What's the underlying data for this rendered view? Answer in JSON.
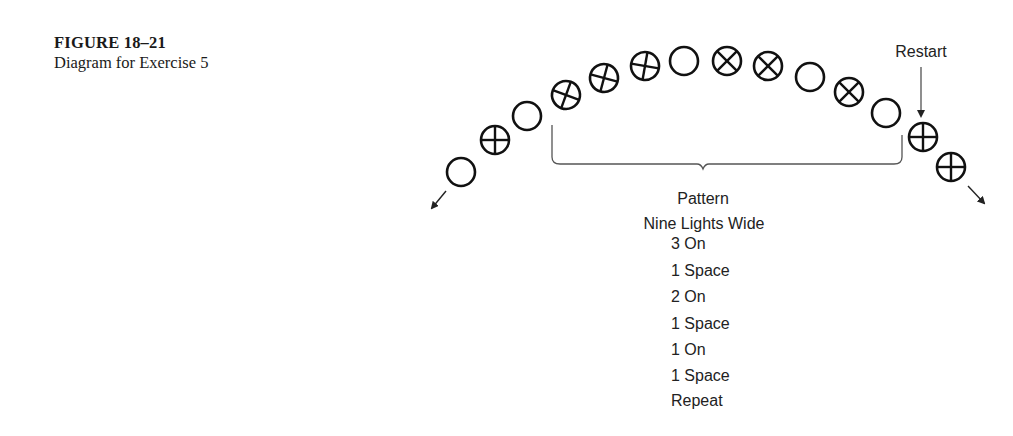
{
  "caption": {
    "figure_number": "FIGURE 18–21",
    "description": "Diagram for Exercise 5"
  },
  "diagram": {
    "restart_label": "Restart",
    "pattern_title": "Pattern",
    "pattern_subtitle": "Nine Lights Wide",
    "pattern_steps": [
      "3 On",
      "1 Space",
      "2 On",
      "1 Space",
      "1 On",
      "1 Space",
      "Repeat"
    ],
    "lights": [
      {
        "x": 461,
        "y": 172,
        "state": "off"
      },
      {
        "x": 495,
        "y": 140,
        "state": "on-plus"
      },
      {
        "x": 527,
        "y": 116,
        "state": "off"
      },
      {
        "x": 566,
        "y": 95,
        "state": "on",
        "rot": 20
      },
      {
        "x": 604,
        "y": 78,
        "state": "on",
        "rot": 15
      },
      {
        "x": 645,
        "y": 66,
        "state": "on",
        "rot": 10
      },
      {
        "x": 684,
        "y": 61,
        "state": "off"
      },
      {
        "x": 727,
        "y": 61,
        "state": "on",
        "rot": 45
      },
      {
        "x": 768,
        "y": 66,
        "state": "on",
        "rot": 45
      },
      {
        "x": 810,
        "y": 77,
        "state": "off"
      },
      {
        "x": 849,
        "y": 92,
        "state": "on",
        "rot": 45
      },
      {
        "x": 886,
        "y": 113,
        "state": "off"
      },
      {
        "x": 923,
        "y": 137,
        "state": "on-plus"
      },
      {
        "x": 951,
        "y": 167,
        "state": "on-plus"
      }
    ],
    "colors": {
      "stroke": "#111111",
      "bracket": "#555555",
      "text": "#222222"
    }
  }
}
